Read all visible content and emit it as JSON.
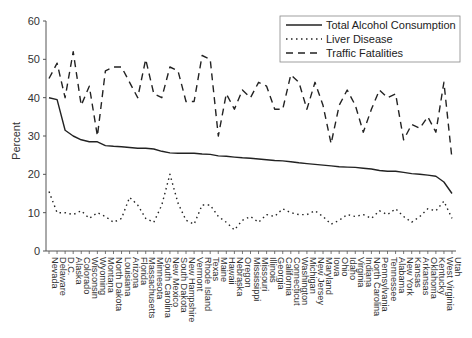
{
  "chart_data": {
    "type": "line",
    "title": "",
    "xlabel": "",
    "ylabel": "Percent",
    "ylim": [
      0,
      60
    ],
    "yticks": [
      0,
      10,
      20,
      30,
      40,
      50,
      60
    ],
    "grid": false,
    "legend_position": "upper right",
    "categories": [
      "Nevada",
      "Delaware",
      "D.C.",
      "Alaska",
      "Colorado",
      "Wisconsin",
      "Wyoming",
      "Montana",
      "North Dakota",
      "Louisiana",
      "Arizona",
      "Florida",
      "Massachusetts",
      "Minnesota",
      "South Carolina",
      "New Mexico",
      "South Dakota",
      "New Hampshire",
      "Vermont",
      "Rhode Island",
      "Texas",
      "Maine",
      "Hawaii",
      "Nebraska",
      "Oregon",
      "Mississippi",
      "Missouri",
      "Illinois",
      "Georgia",
      "California",
      "Connecticut",
      "Washington",
      "Michigan",
      "New Jersey",
      "Maryland",
      "Iowa",
      "Ohio",
      "Idaho",
      "Virginia",
      "Indiana",
      "North Carolina",
      "Pennsylvania",
      "Tennessee",
      "Alabama",
      "New York",
      "Kansas",
      "Arkansas",
      "Oklahoma",
      "Kentucky",
      "West Virginia",
      "Utah"
    ],
    "series": [
      {
        "name": "Total Alcohol Consumption",
        "style": "solid",
        "values": [
          40,
          39.5,
          31.5,
          30,
          29,
          28.5,
          28.5,
          27.5,
          27.3,
          27.2,
          27,
          26.8,
          26.8,
          26.6,
          26,
          25.6,
          25.5,
          25.5,
          25.5,
          25.3,
          25.2,
          24.8,
          24.7,
          24.5,
          24.3,
          24.2,
          24,
          23.8,
          23.6,
          23.5,
          23.3,
          23,
          22.8,
          22.6,
          22.4,
          22.2,
          22,
          21.9,
          21.8,
          21.6,
          21.4,
          21,
          20.8,
          20.8,
          20.5,
          20.2,
          20,
          19.8,
          19.5,
          18,
          15
        ]
      },
      {
        "name": "Liver Disease",
        "style": "dotted",
        "values": [
          15.5,
          10,
          10,
          9.5,
          10.5,
          8.5,
          10,
          9,
          7.5,
          8.5,
          14,
          12,
          8.5,
          7.5,
          12,
          20,
          12.5,
          8,
          7,
          12,
          12,
          9,
          7.5,
          5.5,
          8,
          9,
          7.5,
          9.5,
          9,
          11,
          10,
          9.5,
          9.5,
          10.5,
          9,
          7,
          8,
          9.5,
          9,
          9.5,
          8.5,
          10.5,
          9.5,
          11,
          9,
          7.5,
          9,
          11,
          10.5,
          13,
          8.5
        ]
      },
      {
        "name": "Traffic Fatalities",
        "style": "dashed",
        "values": [
          45,
          49,
          40,
          52,
          38,
          43,
          30,
          47,
          48,
          48,
          44,
          40,
          50,
          41,
          40,
          48,
          47,
          39,
          39,
          51,
          50,
          30,
          41,
          37,
          42,
          40,
          44,
          43,
          37,
          37,
          46,
          44,
          37,
          44,
          38,
          28,
          38,
          42,
          38,
          31,
          37,
          42,
          40,
          41,
          29,
          33,
          32,
          35,
          31,
          44,
          24
        ]
      }
    ]
  },
  "legend": {
    "items": [
      {
        "label": "Total Alcohol Consumption"
      },
      {
        "label": "Liver Disease"
      },
      {
        "label": "Traffic Fatalities"
      }
    ]
  },
  "colors": {
    "line": "#222222",
    "axis": "#555555",
    "background": "#ffffff"
  }
}
